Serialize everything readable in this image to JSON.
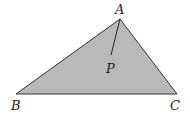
{
  "diagram": {
    "title": "",
    "fill_color": "#b9b9b9",
    "stroke_color": "#333333",
    "vertices": {
      "A": {
        "label": "A",
        "x": 120,
        "y": 19
      },
      "B": {
        "label": "B",
        "x": 16,
        "y": 94
      },
      "C": {
        "label": "C",
        "x": 177,
        "y": 94
      }
    },
    "segment_AP": {
      "from": "A",
      "to_x": 111,
      "to_y": 55
    },
    "point_P": {
      "label": "P"
    }
  }
}
